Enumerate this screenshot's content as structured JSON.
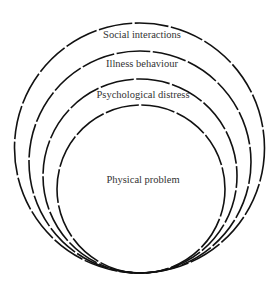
{
  "diagram": {
    "type": "nested-tangent-circles",
    "stroke_color": "#111111",
    "text_color": "#333333",
    "background": "#ffffff",
    "layers": [
      {
        "label": "Social interactions",
        "level": 4
      },
      {
        "label": "Illness behaviour",
        "level": 3
      },
      {
        "label": "Psychological distress",
        "level": 2
      },
      {
        "label": "Physical problem",
        "level": 1
      }
    ]
  }
}
